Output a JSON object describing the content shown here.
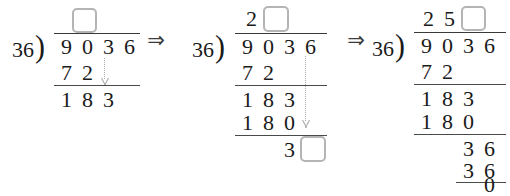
{
  "worksheet": {
    "title": "Long division of 9036 by 36 — three progressive steps",
    "divisor": "36",
    "dividend": "9036",
    "bracket_glyph": ")",
    "arrow_glyph": "⇒",
    "box_border_color": "#b4b4b4",
    "ink_color": "#1a1a1a",
    "hint_color": "#a8a8a8"
  },
  "arrows": {
    "arrow_1": "⇒",
    "arrow_2": "⇒"
  },
  "panels": [
    {
      "id": "panel-1",
      "label": "step-1",
      "quotient": {
        "digits": [],
        "blank_boxes": 1
      },
      "divisor": "36",
      "bracket": ")",
      "dividend": [
        "9",
        "0",
        "3",
        "6"
      ],
      "rows": [
        {
          "name": "subtract-1",
          "digits": [
            "7",
            "2"
          ]
        },
        {
          "name": "remainder-1",
          "digits": [
            "1",
            "8",
            "3"
          ]
        }
      ],
      "bring_down_hint": true
    },
    {
      "id": "panel-2",
      "label": "step-2",
      "quotient": {
        "digits": [
          "2"
        ],
        "blank_boxes": 1
      },
      "divisor": "36",
      "bracket": ")",
      "dividend": [
        "9",
        "0",
        "3",
        "6"
      ],
      "rows": [
        {
          "name": "subtract-1",
          "digits": [
            "7",
            "2"
          ]
        },
        {
          "name": "remainder-1",
          "digits": [
            "1",
            "8",
            "3"
          ]
        },
        {
          "name": "subtract-2",
          "digits": [
            "1",
            "8",
            "0"
          ]
        },
        {
          "name": "remainder-2",
          "digits": [
            "3"
          ],
          "blank_boxes": 1
        }
      ],
      "bring_down_hint": true
    },
    {
      "id": "panel-3",
      "label": "step-3",
      "quotient": {
        "digits": [
          "2",
          "5"
        ],
        "blank_boxes": 1
      },
      "divisor": "36",
      "bracket": ")",
      "dividend": [
        "9",
        "0",
        "3",
        "6"
      ],
      "rows": [
        {
          "name": "subtract-1",
          "digits": [
            "7",
            "2"
          ]
        },
        {
          "name": "remainder-1",
          "digits": [
            "1",
            "8",
            "3"
          ]
        },
        {
          "name": "subtract-2",
          "digits": [
            "1",
            "8",
            "0"
          ]
        },
        {
          "name": "remainder-2",
          "digits": [
            "3",
            "6"
          ]
        },
        {
          "name": "subtract-3",
          "digits": [
            "3",
            "6"
          ]
        },
        {
          "name": "remainder-3",
          "digits": [
            "0"
          ]
        }
      ],
      "bring_down_hint": false
    }
  ]
}
